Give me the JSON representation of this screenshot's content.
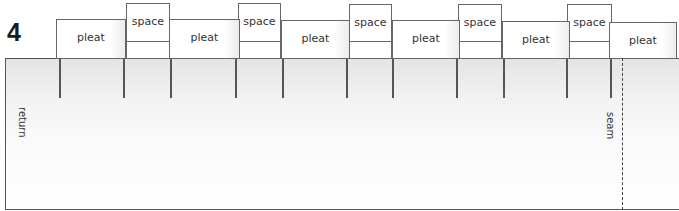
{
  "diagram": {
    "step_number": "4",
    "side_labels": {
      "left": "return",
      "right": "seam"
    },
    "pleats": [
      {
        "label": "pleat",
        "x": 56,
        "y": 19,
        "w": 70,
        "h": 40
      },
      {
        "label": "pleat",
        "x": 169,
        "y": 19,
        "w": 71,
        "h": 40
      },
      {
        "label": "pleat",
        "x": 281,
        "y": 20,
        "w": 69,
        "h": 39
      },
      {
        "label": "pleat",
        "x": 392,
        "y": 20,
        "w": 68,
        "h": 39
      },
      {
        "label": "pleat",
        "x": 502,
        "y": 21,
        "w": 68,
        "h": 38
      },
      {
        "label": "pleat",
        "x": 609,
        "y": 22,
        "w": 68,
        "h": 37
      }
    ],
    "spaces": [
      {
        "label": "space",
        "x": 126,
        "y": 3,
        "w": 44,
        "h": 56
      },
      {
        "label": "space",
        "x": 238,
        "y": 3,
        "w": 43,
        "h": 56
      },
      {
        "label": "space",
        "x": 349,
        "y": 4,
        "w": 43,
        "h": 55
      },
      {
        "label": "space",
        "x": 458,
        "y": 4,
        "w": 44,
        "h": 55
      },
      {
        "label": "space",
        "x": 567,
        "y": 4,
        "w": 45,
        "h": 55
      }
    ],
    "fold_lines_x": [
      60,
      124,
      171,
      236,
      283,
      347,
      393,
      457,
      504,
      567,
      611
    ],
    "seam_x": 622,
    "colors": {
      "line": "#555555",
      "text": "#333333",
      "panel_top": "#e4e4e4",
      "panel_bottom": "#ffffff"
    }
  }
}
